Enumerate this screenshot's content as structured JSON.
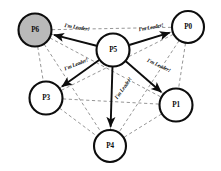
{
  "diagram": {
    "type": "leader-election-broadcast-graph",
    "canvas": {
      "width": 221,
      "height": 171,
      "background": "#ffffff"
    },
    "colors": {
      "node_fill": "#ffffff",
      "node_shaded_fill": "#b9b9b9",
      "node_stroke": "#0d0d0d",
      "mesh_edge": "#8a8a8a",
      "broadcast_edge": "#0d0d0d",
      "text": "#0a0a0a"
    },
    "nodes": [
      {
        "id": "P6",
        "label": "P6",
        "cx": 35,
        "cy": 30,
        "r": 16.5,
        "shaded": true,
        "role": "peer"
      },
      {
        "id": "P0",
        "label": "P0",
        "cx": 188,
        "cy": 27,
        "r": 16.0,
        "shaded": false,
        "role": "peer"
      },
      {
        "id": "P5",
        "label": "P5",
        "cx": 113,
        "cy": 50,
        "r": 16.5,
        "shaded": false,
        "role": "leader"
      },
      {
        "id": "P3",
        "label": "P3",
        "cx": 46,
        "cy": 98,
        "r": 16.5,
        "shaded": false,
        "role": "peer"
      },
      {
        "id": "P1",
        "label": "P1",
        "cx": 176,
        "cy": 105,
        "r": 16.5,
        "shaded": false,
        "role": "peer"
      },
      {
        "id": "P4",
        "label": "P4",
        "cx": 110,
        "cy": 146,
        "r": 16.0,
        "shaded": false,
        "role": "peer"
      }
    ],
    "broadcast_edges": [
      {
        "from": "P5",
        "to": "P6",
        "label": "I'm Leader!",
        "label_x": 77,
        "label_y": 27
      },
      {
        "from": "P5",
        "to": "P0",
        "label": "I'm Leader!",
        "label_x": 151,
        "label_y": 27
      },
      {
        "from": "P5",
        "to": "P3",
        "label": "I'm Leader!",
        "label_x": 76,
        "label_y": 64
      },
      {
        "from": "P5",
        "to": "P1",
        "label": "I'm Leader!",
        "label_x": 159,
        "label_y": 65
      },
      {
        "from": "P5",
        "to": "P4",
        "label": "I'm Leader!",
        "label_x": 123,
        "label_y": 88
      }
    ],
    "mesh_edges": [
      {
        "from": "P6",
        "to": "P0"
      },
      {
        "from": "P6",
        "to": "P3"
      },
      {
        "from": "P6",
        "to": "P1"
      },
      {
        "from": "P6",
        "to": "P4"
      },
      {
        "from": "P6",
        "to": "P5"
      },
      {
        "from": "P0",
        "to": "P3"
      },
      {
        "from": "P0",
        "to": "P1"
      },
      {
        "from": "P0",
        "to": "P4"
      },
      {
        "from": "P0",
        "to": "P5"
      },
      {
        "from": "P3",
        "to": "P1"
      },
      {
        "from": "P3",
        "to": "P4"
      },
      {
        "from": "P3",
        "to": "P5"
      },
      {
        "from": "P1",
        "to": "P4"
      },
      {
        "from": "P1",
        "to": "P5"
      },
      {
        "from": "P4",
        "to": "P5"
      }
    ]
  }
}
